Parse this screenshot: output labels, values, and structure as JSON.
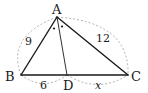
{
  "diagram": {
    "type": "triangle-angle-bisector",
    "vertices": {
      "A": {
        "label": "A",
        "x": 57,
        "y": 17
      },
      "B": {
        "label": "B",
        "x": 21,
        "y": 75
      },
      "C": {
        "label": "C",
        "x": 128,
        "y": 75
      },
      "D": {
        "label": "D",
        "x": 67,
        "y": 75
      }
    },
    "segments": [
      {
        "from": "A",
        "to": "B",
        "length_label": "9"
      },
      {
        "from": "A",
        "to": "C",
        "length_label": "12"
      },
      {
        "from": "B",
        "to": "D",
        "length_label": "6"
      },
      {
        "from": "D",
        "to": "C",
        "length_label": "x"
      },
      {
        "from": "A",
        "to": "D",
        "length_label": ""
      }
    ],
    "angle_marks": {
      "vertex": "A",
      "mark": "•",
      "count": 2,
      "meaning": "equal angles BAD = DAC"
    },
    "colors": {
      "line": "#1a1a1a",
      "dashed": "#999999"
    }
  }
}
